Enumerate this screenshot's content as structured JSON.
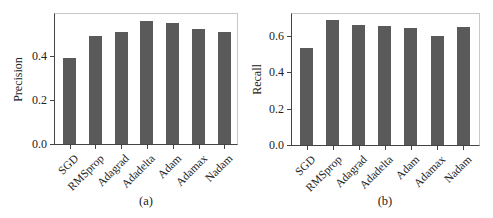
{
  "chart_data": [
    {
      "type": "bar",
      "panel": "(a)",
      "title": "",
      "xlabel": "",
      "ylabel": "Precision",
      "categories": [
        "SGD",
        "RMSprop",
        "Adagrad",
        "Adadelta",
        "Adam",
        "Adamax",
        "Nadam"
      ],
      "values": [
        0.39,
        0.49,
        0.51,
        0.56,
        0.55,
        0.525,
        0.51
      ],
      "ylim": [
        0,
        0.6
      ],
      "yticks": [
        "0.0",
        "0.2",
        "0.4"
      ],
      "ytick_values": [
        0.0,
        0.2,
        0.4
      ],
      "grid": false,
      "bar_color": "#5a5a5a"
    },
    {
      "type": "bar",
      "panel": "(b)",
      "title": "",
      "xlabel": "",
      "ylabel": "Recall",
      "categories": [
        "SGD",
        "RMSprop",
        "Adagrad",
        "Adadelta",
        "Adam",
        "Adamax",
        "Nadam"
      ],
      "values": [
        0.53,
        0.685,
        0.655,
        0.65,
        0.64,
        0.6,
        0.645
      ],
      "ylim": [
        0,
        0.71
      ],
      "yticks": [
        "0.0",
        "0.2",
        "0.4",
        "0.6"
      ],
      "ytick_values": [
        0.0,
        0.2,
        0.4,
        0.6
      ],
      "grid": false,
      "bar_color": "#5a5a5a"
    }
  ],
  "panels": [
    {
      "caption": "(a)",
      "ylabel": "Precision"
    },
    {
      "caption": "(b)",
      "ylabel": "Recall"
    }
  ]
}
